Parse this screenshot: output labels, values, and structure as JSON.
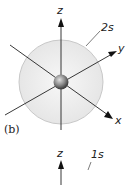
{
  "figure": {
    "panel_label": "(b)",
    "top_diagram": {
      "orbital_label": "2s",
      "axes": {
        "z": "z",
        "y": "y",
        "x": "x"
      },
      "sphere_color": "#ececec",
      "sphere_edge": "#c8c8c8",
      "nucleus_color": "#888888"
    },
    "bottom_diagram": {
      "orbital_label": "1s",
      "axes": {
        "z": "z"
      }
    }
  }
}
